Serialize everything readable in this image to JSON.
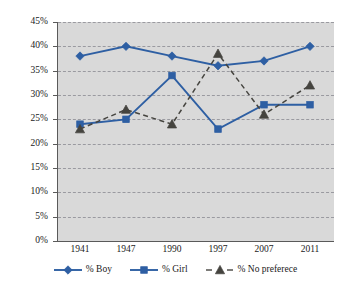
{
  "chart_data": {
    "type": "line",
    "title": "",
    "subtitle": "",
    "xlabel": "",
    "ylabel": "",
    "categories": [
      "1941",
      "1947",
      "1990",
      "1997",
      "2007",
      "2011"
    ],
    "ylim": [
      0,
      45
    ],
    "ytick_labels": [
      "0%",
      "5%",
      "10%",
      "15%",
      "20%",
      "25%",
      "30%",
      "35%",
      "40%",
      "45%"
    ],
    "ytick_values": [
      0,
      5,
      10,
      15,
      20,
      25,
      30,
      35,
      40,
      45
    ],
    "grid": true,
    "legend_position": "bottom",
    "series": [
      {
        "name": "% Boy",
        "values": [
          38,
          40,
          38,
          36,
          37,
          40
        ],
        "color": "#2e5fa3",
        "marker": "diamond",
        "line_style": "solid"
      },
      {
        "name": "% Girl",
        "values": [
          24,
          25,
          34,
          23,
          28,
          28
        ],
        "color": "#2e5fa3",
        "marker": "square",
        "line_style": "solid"
      },
      {
        "name": "% No preferece",
        "values": [
          23,
          27,
          24,
          38.5,
          26,
          32
        ],
        "color": "#45443f",
        "marker": "triangle",
        "line_style": "dashed"
      }
    ]
  },
  "legend": {
    "items": [
      {
        "label": "% Boy"
      },
      {
        "label": "% Girl"
      },
      {
        "label": "% No preferece"
      }
    ]
  },
  "colors": {
    "plot_background": "#d9d9d9",
    "page_background": "#ffffff",
    "gridline": "#9a9aa0",
    "axis": "#5a5a5a",
    "series_blue": "#2e5fa3",
    "series_gray": "#45443f",
    "text": "#1a1a1a"
  }
}
